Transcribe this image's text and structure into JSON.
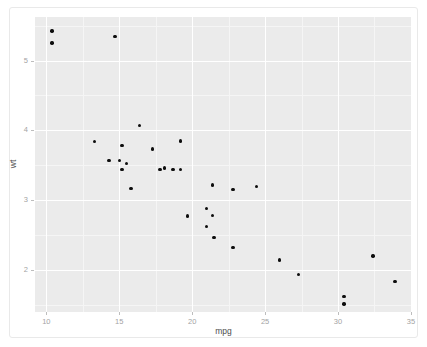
{
  "chart_data": {
    "type": "scatter",
    "title": "",
    "xlabel": "mpg",
    "ylabel": "wt",
    "xlim": [
      9.225,
      35.075
    ],
    "ylim": [
      1.3955,
      5.6235
    ],
    "xticks": [
      10,
      15,
      20,
      25,
      30,
      35
    ],
    "yticks": [
      2,
      3,
      4,
      5
    ],
    "xticklabels": [
      "10",
      "15",
      "20",
      "25",
      "30",
      "35"
    ],
    "yticklabels": [
      "2",
      "3",
      "4",
      "5"
    ],
    "x_minor_ticks": [
      12.5,
      17.5,
      22.5,
      27.5,
      32.5
    ],
    "y_minor_ticks": [
      1.5,
      2.5,
      3.5,
      4.5,
      5.5
    ],
    "grid": true,
    "legend": "none",
    "panel_background": "#ebebeb",
    "grid_color": "#ffffff",
    "point_color": "#0d0d0d",
    "point_size": 3.4,
    "x": [
      21.0,
      21.0,
      22.8,
      21.4,
      18.7,
      18.1,
      14.3,
      24.4,
      22.8,
      19.2,
      17.8,
      16.4,
      17.3,
      15.2,
      10.4,
      10.4,
      14.7,
      32.4,
      30.4,
      33.9,
      21.5,
      15.5,
      15.2,
      13.3,
      19.2,
      27.3,
      26.0,
      30.4,
      15.8,
      19.7,
      15.0,
      21.4
    ],
    "y": [
      2.62,
      2.875,
      2.32,
      3.215,
      3.44,
      3.46,
      3.57,
      3.19,
      3.15,
      3.44,
      3.44,
      4.07,
      3.73,
      3.78,
      5.25,
      5.424,
      5.345,
      2.2,
      1.615,
      1.835,
      2.465,
      3.52,
      3.435,
      3.84,
      3.845,
      1.935,
      2.14,
      1.513,
      3.17,
      2.77,
      3.57,
      2.78
    ]
  },
  "axis": {
    "x_title": "mpg",
    "y_title": "wt"
  }
}
